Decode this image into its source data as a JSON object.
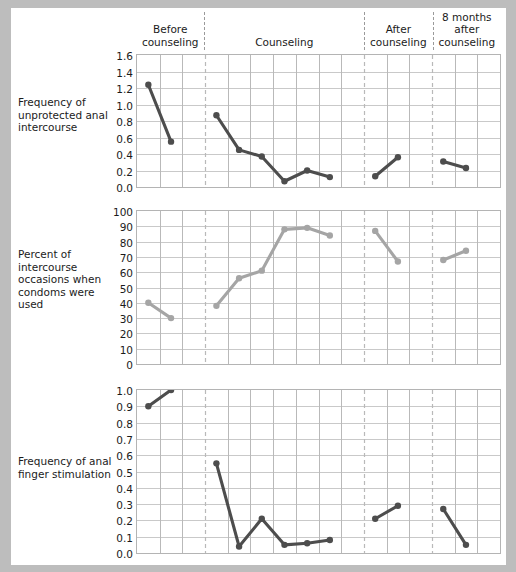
{
  "xaxis": {
    "title": "Bi-weekly periods"
  },
  "phases": [
    {
      "id": "before",
      "label": "Before\ncounseling"
    },
    {
      "id": "during",
      "label": "Counseling"
    },
    {
      "id": "after",
      "label": "After\ncounseling"
    },
    {
      "id": "follow",
      "label": "8 months\nafter\ncounseling"
    }
  ],
  "colors": {
    "dark_series": "#4d4d4d",
    "light_series": "#a5a5a5",
    "grid": "#c9c9c9",
    "divider": "#b9b9b9",
    "page_background": "#ffffff",
    "frame": "#bdbdbd"
  },
  "chart_data": [
    {
      "type": "line",
      "title": "Frequency of unprotected anal intercourse",
      "xlabel": "Bi-weekly periods",
      "ylabel": "Frequency of unprotected anal intercourse",
      "ylim": [
        0.0,
        1.6
      ],
      "yticks": [
        "0.0",
        "0.2",
        "0.4",
        "0.6",
        "0.8",
        "1.0",
        "1.2",
        "1.4",
        "1.6"
      ],
      "grid": true,
      "legend": "none",
      "series_color": "#4d4d4d",
      "segments": [
        {
          "phase": "before",
          "x": [
            1,
            2
          ],
          "y": [
            1.24,
            0.55
          ]
        },
        {
          "phase": "during",
          "x": [
            4,
            5,
            6,
            7,
            8,
            9
          ],
          "y": [
            0.87,
            0.45,
            0.37,
            0.07,
            0.2,
            0.12
          ]
        },
        {
          "phase": "after",
          "x": [
            11,
            12
          ],
          "y": [
            0.13,
            0.36
          ]
        },
        {
          "phase": "follow",
          "x": [
            14,
            15
          ],
          "y": [
            0.31,
            0.23
          ]
        }
      ]
    },
    {
      "type": "line",
      "title": "Percent of intercourse occasions when condoms were used",
      "xlabel": "Bi-weekly periods",
      "ylabel": "Percent of intercourse occasions when condoms were used",
      "ylim": [
        0,
        100
      ],
      "yticks": [
        "0",
        "10",
        "20",
        "30",
        "40",
        "50",
        "60",
        "70",
        "80",
        "90",
        "100"
      ],
      "grid": true,
      "legend": "none",
      "series_color": "#a5a5a5",
      "segments": [
        {
          "phase": "before",
          "x": [
            1,
            2
          ],
          "y": [
            40,
            30
          ]
        },
        {
          "phase": "during",
          "x": [
            4,
            5,
            6,
            7,
            8,
            9
          ],
          "y": [
            38,
            56,
            61,
            88,
            89,
            84
          ]
        },
        {
          "phase": "after",
          "x": [
            11,
            12
          ],
          "y": [
            87,
            67
          ]
        },
        {
          "phase": "follow",
          "x": [
            14,
            15
          ],
          "y": [
            68,
            74
          ]
        }
      ]
    },
    {
      "type": "line",
      "title": "Frequency of anal finger stimulation",
      "xlabel": "Bi-weekly periods",
      "ylabel": "Frequency of anal finger stimulation",
      "ylim": [
        0.0,
        1.0
      ],
      "yticks": [
        "0.0",
        "0.1",
        "0.2",
        "0.3",
        "0.4",
        "0.5",
        "0.6",
        "0.7",
        "0.8",
        "0.9",
        "1.0"
      ],
      "grid": true,
      "legend": "none",
      "series_color": "#4d4d4d",
      "segments": [
        {
          "phase": "before",
          "x": [
            1,
            2
          ],
          "y": [
            0.9,
            1.0
          ]
        },
        {
          "phase": "during",
          "x": [
            4,
            5,
            6,
            7,
            8,
            9
          ],
          "y": [
            0.55,
            0.04,
            0.21,
            0.05,
            0.06,
            0.08
          ]
        },
        {
          "phase": "after",
          "x": [
            11,
            12
          ],
          "y": [
            0.21,
            0.29
          ]
        },
        {
          "phase": "follow",
          "x": [
            14,
            15
          ],
          "y": [
            0.27,
            0.05
          ]
        }
      ]
    }
  ]
}
